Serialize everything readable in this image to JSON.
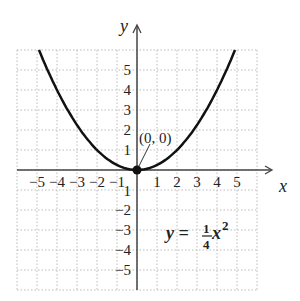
{
  "chart_data": {
    "type": "line",
    "title": "",
    "xlabel": "x",
    "ylabel": "y",
    "xlim": [
      -6,
      6
    ],
    "ylim": [
      -6,
      6
    ],
    "grid": true,
    "x_ticks": [
      "-5",
      "-4",
      "-3",
      "-2",
      "-1",
      "1",
      "2",
      "3",
      "4",
      "5"
    ],
    "y_ticks": [
      "5",
      "4",
      "3",
      "2",
      "1",
      "-1",
      "-2",
      "-3",
      "-4",
      "-5"
    ],
    "series": [
      {
        "name": "y = 1/4 x^2",
        "function": "0.25*x^2",
        "x_range": [
          -4.9,
          4.9
        ]
      }
    ],
    "annotations": [
      {
        "text": "(0, 0)",
        "point": [
          0,
          0
        ]
      },
      {
        "text": "y = 1/4 x^2",
        "position": [
          2.5,
          -3.2
        ]
      }
    ]
  },
  "labels": {
    "x_axis": "x",
    "y_axis": "y",
    "point": "(0, 0)",
    "eq_lhs": "y =",
    "eq_num": "1",
    "eq_den": "4",
    "eq_rhs": "x",
    "eq_exp": "2"
  }
}
